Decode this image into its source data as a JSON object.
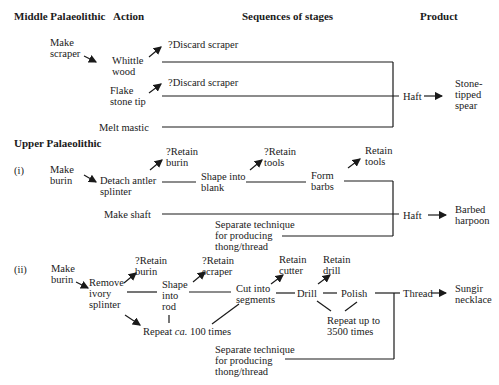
{
  "headers": {
    "middle": "Middle Palaeolithic",
    "action": "Action",
    "sequences": "Sequences of stages",
    "product": "Product",
    "upper": "Upper Palaeolithic"
  },
  "middle": {
    "make_scraper": "Make\nscraper",
    "whittle_wood": "Whittle\nwood",
    "discard1": "?Discard scraper",
    "flake_tip": "Flake\nstone tip",
    "discard2": "?Discard scraper",
    "melt_mastic": "Melt mastic",
    "haft": "Haft",
    "product": "Stone-\ntipped\nspear"
  },
  "upper_i": {
    "label": "(i)",
    "make_burin": "Make\nburin",
    "detach": "Detach antler\nsplinter",
    "retain_burin": "?Retain\nburin",
    "shape_blank": "Shape into\nblank",
    "retain_tools_q": "?Retain\ntools",
    "form_barbs": "Form\nbarbs",
    "retain_tools": "Retain\ntools",
    "make_shaft": "Make shaft",
    "separate": "Separate technique\nfor producing\nthong/thread",
    "haft": "Haft",
    "product": "Barbed\nharpoon"
  },
  "upper_ii": {
    "label": "(ii)",
    "make_burin": "Make\nburin",
    "remove": "Remove\nivory\nsplinter",
    "retain_burin": "?Retain\nburin",
    "shape_rod": "Shape\ninto\nrod",
    "retain_scraper": "?Retain\nscraper",
    "cut": "Cut into\nsegments",
    "retain_cutter": "Retain\ncutter",
    "drill": "Drill",
    "retain_drill": "Retain\ndrill",
    "polish": "Polish",
    "repeat100_a": "Repeat ",
    "repeat100_ca": "ca.",
    "repeat100_b": " 100 times",
    "repeat3500": "Repeat up to\n3500 times",
    "separate": "Separate technique\nfor producing\nthong/thread",
    "thread": "Thread",
    "product": "Sungir\nnecklace"
  }
}
